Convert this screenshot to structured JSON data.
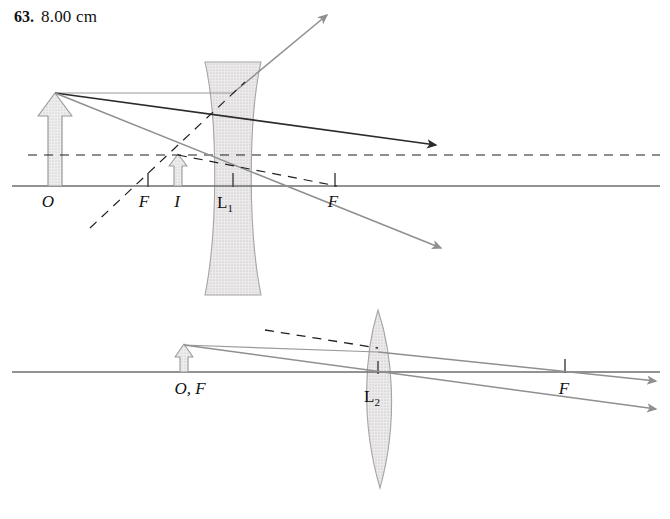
{
  "header": {
    "problem_number": "63.",
    "answer": "8.00 cm"
  },
  "colors": {
    "axis": "#6e6e6e",
    "ray_solid_dark": "#2b2b2b",
    "ray_solid_gray": "#8a8a8a",
    "ray_dashed": "#1f1f1f",
    "lens_fill": "#dcdcdc",
    "lens_stroke": "#9a9a9a",
    "object_fill": "#e2e2e2",
    "object_stroke": "#8a8a8a",
    "text": "#111111"
  },
  "figure": {
    "type": "ray-diagram",
    "caption": "",
    "diagrams": [
      {
        "id": "upper",
        "lens_type": "diverging",
        "lens_label": "L",
        "lens_label_sub": "1",
        "axis": {
          "y": 186,
          "x_start": 12,
          "x_end": 660
        },
        "lens": {
          "center_x": 233,
          "top_y": 62,
          "bottom_y": 295,
          "edge_half_width": 28,
          "waist_half_width": 15
        },
        "object": {
          "label": "O",
          "x": 55,
          "base_y": 186,
          "tip_y": 93,
          "height_px": 93
        },
        "image": {
          "label": "I",
          "x": 178,
          "base_y": 186,
          "tip_y": 155,
          "height_px": 31
        },
        "focal_points": [
          {
            "label": "F",
            "x": 148,
            "side": "left-of-lens"
          },
          {
            "label": "F",
            "x": 335,
            "side": "right-of-lens"
          }
        ],
        "labels": [
          {
            "text": "O",
            "x": 48,
            "y": 206
          },
          {
            "text": "F",
            "x": 142,
            "y": 206
          },
          {
            "text": "I",
            "x": 175,
            "y": 206
          },
          {
            "text": "L",
            "sub": "1",
            "x": 222,
            "y": 206
          },
          {
            "text": "F",
            "x": 330,
            "y": 206
          }
        ],
        "rays": [
          {
            "name": "parallel-incident-ray",
            "style": "solid-gray",
            "from": [
              55,
              93
            ],
            "to": [
              233,
              93
            ]
          },
          {
            "name": "refracted-ray-up-right",
            "style": "solid-gray",
            "from": [
              233,
              93
            ],
            "to": [
              330,
              12
            ],
            "arrowhead": true
          },
          {
            "name": "chief-ray-through-center",
            "style": "solid-dark",
            "from": [
              55,
              93
            ],
            "to": [
              440,
              146
            ],
            "arrowhead": true
          },
          {
            "name": "ray-to-lens-lower",
            "style": "solid-gray",
            "from": [
              55,
              93
            ],
            "to": [
              445,
              250
            ],
            "arrowhead": true
          },
          {
            "name": "virtual-focus-dashed-axis",
            "style": "dashed",
            "from": [
              28,
              155
            ],
            "to": [
              660,
              155
            ]
          },
          {
            "name": "virtual-extension-up-left",
            "style": "dashed",
            "from": [
              90,
              228
            ],
            "to": [
              233,
              93
            ]
          },
          {
            "name": "virtual-extension-down-right",
            "style": "dashed",
            "from": [
              178,
              155
            ],
            "to": [
              335,
              186
            ]
          }
        ]
      },
      {
        "id": "lower",
        "lens_type": "converging",
        "lens_label": "L",
        "lens_label_sub": "2",
        "axis": {
          "y": 372,
          "x_start": 12,
          "x_end": 660
        },
        "lens": {
          "center_x": 378,
          "top_y": 310,
          "bottom_y": 488,
          "half_width": 20
        },
        "object": {
          "label": "O, F",
          "x": 184,
          "base_y": 372,
          "tip_y": 345,
          "height_px": 27
        },
        "focal_points": [
          {
            "label": "F",
            "x": 565,
            "side": "right-of-lens"
          }
        ],
        "labels": [
          {
            "text": "O, F",
            "x": 166,
            "y": 392
          },
          {
            "text": "L",
            "sub": "2",
            "x": 367,
            "y": 400
          },
          {
            "text": "F",
            "x": 560,
            "y": 392
          }
        ],
        "rays": [
          {
            "name": "incident-ray-to-lens",
            "style": "solid-gray",
            "from": [
              184,
              345
            ],
            "to": [
              378,
              352
            ]
          },
          {
            "name": "refracted-ray-upper",
            "style": "solid-gray",
            "from": [
              378,
              352
            ],
            "to": [
              660,
              383
            ],
            "arrowhead": true
          },
          {
            "name": "chief-ray-lower",
            "style": "solid-gray",
            "from": [
              184,
              345
            ],
            "to": [
              660,
              410
            ],
            "arrowhead": true
          },
          {
            "name": "virtual-extension-dashed",
            "style": "dashed",
            "from": [
              265,
              330
            ],
            "to": [
              378,
              348
            ]
          }
        ]
      }
    ]
  }
}
